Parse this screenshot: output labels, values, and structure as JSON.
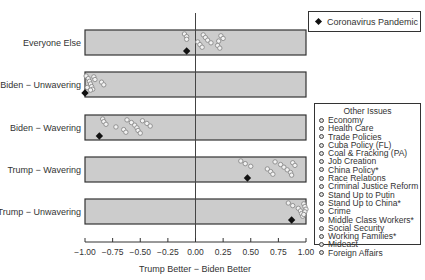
{
  "chart_data": {
    "type": "scatter",
    "title": "",
    "xlabel": "Trump Better − Biden Better",
    "ylabel": "",
    "xlim": [
      -1.0,
      1.0
    ],
    "x_ticks": [
      "−1.00",
      "−0.75",
      "−0.50",
      "−0.25",
      "0.00",
      "0.25",
      "0.50",
      "0.75",
      "1.00"
    ],
    "x_tick_values": [
      -1.0,
      -0.75,
      -0.5,
      -0.25,
      0.0,
      0.25,
      0.5,
      0.75,
      1.0
    ],
    "categories": [
      "Everyone Else",
      "Biden − Unwavering",
      "Biden − Wavering",
      "Trump − Wavering",
      "Trump − Unwavering"
    ],
    "grid": false,
    "reference_line_x": 0.0,
    "highlight_series": {
      "name": "Coronavirus Pandemic",
      "marker": "diamond",
      "color": "#111111",
      "values": [
        -0.08,
        -1.0,
        -0.87,
        0.47,
        0.87
      ]
    },
    "other_series": {
      "name": "Other Issues",
      "marker": "circle",
      "values": [
        [
          -0.1,
          -0.08,
          -0.08,
          0.02,
          0.04,
          0.06,
          0.07,
          0.09,
          0.11,
          0.14,
          0.2,
          0.22,
          0.23,
          0.25,
          0.21
        ],
        [
          -0.99,
          -0.97,
          -0.96,
          -0.95,
          -0.94,
          -0.93,
          -0.92,
          -0.91,
          -0.85,
          -0.83,
          -0.98,
          -0.95
        ],
        [
          -0.84,
          -0.83,
          -0.81,
          -0.72,
          -0.65,
          -0.63,
          -0.62,
          -0.58,
          -0.55,
          -0.53,
          -0.52,
          -0.5,
          -0.48,
          -0.44,
          -0.41
        ],
        [
          0.41,
          0.45,
          0.5,
          0.65,
          0.68,
          0.7,
          0.72,
          0.77,
          0.8,
          0.83,
          0.86,
          0.87,
          0.88,
          0.9
        ],
        [
          0.84,
          0.88,
          0.93,
          0.95,
          0.96,
          0.97,
          0.98,
          0.99,
          1.0,
          0.99,
          0.98
        ]
      ]
    },
    "legend_position": "right",
    "legend_entries": {
      "highlight": "Coronavirus Pandemic",
      "others_title": "Other Issues",
      "others": [
        "Economy",
        "Health Care",
        "Trade Policies",
        "Cuba Policy (FL)",
        "Coal & Fracking (PA)",
        "Job Creation",
        "China Policy*",
        "Race Relations",
        "Criminal Justice Reform",
        "Stand Up to Putin",
        "Stand Up to China*",
        "Crime",
        "Middle Class Workers*",
        "Social Security",
        "Working Families*",
        "Mideast",
        "Foreign Affairs"
      ]
    }
  },
  "colors": {
    "panel_fill": "#cccccc",
    "panel_border": "#333333",
    "point_fill": "#f2f2f2",
    "point_stroke": "#8a8a8a",
    "highlight": "#111111"
  },
  "legend": {
    "highlight_label": "Coronavirus Pandemic",
    "others_title": "Other Issues",
    "others": [
      "Economy",
      "Health Care",
      "Trade Policies",
      "Cuba Policy (FL)",
      "Coal & Fracking (PA)",
      "Job Creation",
      "China Policy*",
      "Race Relations",
      "Criminal Justice Reform",
      "Stand Up to Putin",
      "Stand Up to China*",
      "Crime",
      "Middle Class Workers*",
      "Social Security",
      "Working Families*",
      "Mideast",
      "Foreign Affairs"
    ]
  }
}
